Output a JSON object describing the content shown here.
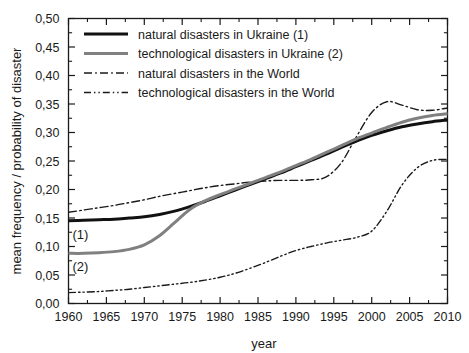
{
  "chart_data": {
    "type": "line",
    "title": "",
    "xlabel": "year",
    "ylabel": "mean frequency / probability of disaster",
    "xlim": [
      1960,
      2010
    ],
    "ylim": [
      0.0,
      0.5
    ],
    "grid": false,
    "legend_position": "top-left",
    "x_ticks": [
      "1960",
      "1965",
      "1970",
      "1975",
      "1980",
      "1985",
      "1990",
      "1995",
      "2000",
      "2005",
      "2010"
    ],
    "y_ticks": [
      "0,00",
      "0,05",
      "0,10",
      "0,15",
      "0,20",
      "0,25",
      "0,30",
      "0,35",
      "0,40",
      "0,45",
      "0,50"
    ],
    "x": [
      1960,
      1962,
      1964,
      1966,
      1968,
      1970,
      1972,
      1974,
      1976,
      1978,
      1980,
      1982,
      1984,
      1986,
      1988,
      1990,
      1992,
      1994,
      1996,
      1998,
      2000,
      2002,
      2004,
      2006,
      2008,
      2010
    ],
    "series": [
      {
        "name": "natural disasters in Ukraine (1)",
        "tag": "(1)",
        "color": "#111111",
        "style": "solid",
        "width": 3.0,
        "values": [
          0.145,
          0.146,
          0.147,
          0.148,
          0.15,
          0.152,
          0.156,
          0.162,
          0.17,
          0.179,
          0.189,
          0.199,
          0.209,
          0.219,
          0.229,
          0.24,
          0.251,
          0.262,
          0.274,
          0.285,
          0.295,
          0.303,
          0.31,
          0.315,
          0.319,
          0.322
        ]
      },
      {
        "name": "technological disasters in Ukraine (2)",
        "tag": "(2)",
        "color": "#808080",
        "style": "solid",
        "width": 3.0,
        "values": [
          0.088,
          0.088,
          0.089,
          0.091,
          0.095,
          0.103,
          0.119,
          0.142,
          0.165,
          0.18,
          0.191,
          0.201,
          0.211,
          0.221,
          0.231,
          0.242,
          0.253,
          0.265,
          0.277,
          0.289,
          0.299,
          0.309,
          0.318,
          0.325,
          0.33,
          0.333
        ]
      },
      {
        "name": "natural disasters in the World",
        "tag": "",
        "color": "#1a1a1a",
        "style": "dash-dot",
        "width": 1.4,
        "values": [
          0.16,
          0.164,
          0.168,
          0.172,
          0.177,
          0.182,
          0.188,
          0.193,
          0.198,
          0.203,
          0.207,
          0.21,
          0.213,
          0.215,
          0.216,
          0.216,
          0.217,
          0.222,
          0.247,
          0.293,
          0.335,
          0.354,
          0.348,
          0.34,
          0.339,
          0.343
        ]
      },
      {
        "name": "technological disasters in the World",
        "tag": "",
        "color": "#1a1a1a",
        "style": "dash-dot-dot",
        "width": 1.4,
        "values": [
          0.019,
          0.02,
          0.021,
          0.023,
          0.025,
          0.028,
          0.031,
          0.034,
          0.037,
          0.041,
          0.046,
          0.053,
          0.062,
          0.072,
          0.083,
          0.093,
          0.1,
          0.106,
          0.111,
          0.116,
          0.127,
          0.162,
          0.208,
          0.238,
          0.251,
          0.253
        ]
      }
    ],
    "legend_entries": [
      {
        "label": "natural disasters in Ukraine (1)",
        "color": "#111111",
        "style": "solid",
        "width": 3.2
      },
      {
        "label": "technological disasters in Ukraine (2)",
        "color": "#808080",
        "style": "solid",
        "width": 3.2
      },
      {
        "label": "natural disasters in the World",
        "color": "#1a1a1a",
        "style": "dash-dot",
        "width": 1.4
      },
      {
        "label": "technological disasters in the World",
        "color": "#1a1a1a",
        "style": "dash-dot-dot",
        "width": 1.4
      }
    ]
  }
}
